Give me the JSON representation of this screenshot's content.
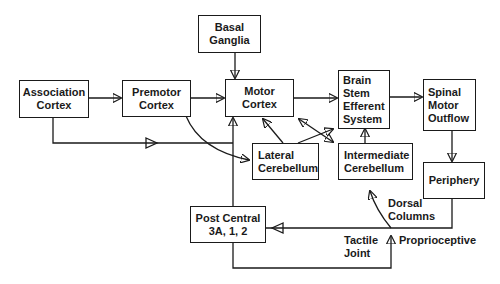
{
  "diagram": {
    "nodes": {
      "basal_ganglia": {
        "line1": "Basal",
        "line2": "Ganglia"
      },
      "association_cortex": {
        "line1": "Association",
        "line2": "Cortex"
      },
      "premotor_cortex": {
        "line1": "Premotor",
        "line2": "Cortex"
      },
      "motor_cortex": {
        "line1": "Motor",
        "line2": "Cortex"
      },
      "brain_stem": {
        "line1": "Brain",
        "line2": "Stem",
        "line3": "Efferent",
        "line4": "System"
      },
      "spinal_motor_outflow": {
        "line1": "Spinal",
        "line2": "Motor",
        "line3": "Outflow"
      },
      "lateral_cerebellum": {
        "line1": "Lateral",
        "line2": "Cerebellum"
      },
      "intermediate_cerebellum": {
        "line1": "Intermediate",
        "line2": "Cerebellum"
      },
      "periphery": {
        "line1": "Periphery"
      },
      "post_central": {
        "line1": "Post Central",
        "line2": "3A, 1, 2"
      }
    },
    "edge_labels": {
      "dorsal": "Dorsal",
      "columns": "Columns",
      "tactile": "Tactile",
      "joint": "Joint",
      "proprioceptive": "Proprioceptive"
    },
    "edges": [
      {
        "from": "Basal Ganglia",
        "to": "Motor Cortex"
      },
      {
        "from": "Association Cortex",
        "to": "Premotor Cortex"
      },
      {
        "from": "Premotor Cortex",
        "to": "Motor Cortex"
      },
      {
        "from": "Motor Cortex",
        "to": "Brain Stem Efferent System"
      },
      {
        "from": "Brain Stem Efferent System",
        "to": "Spinal Motor Outflow"
      },
      {
        "from": "Spinal Motor Outflow",
        "to": "Periphery"
      },
      {
        "from": "Association Cortex",
        "to": "Lateral Cerebellum"
      },
      {
        "from": "Premotor Cortex",
        "to": "Lateral Cerebellum"
      },
      {
        "from": "Lateral Cerebellum",
        "to": "Motor Cortex"
      },
      {
        "from": "Lateral Cerebellum",
        "to": "Brain Stem Efferent System"
      },
      {
        "from": "Motor Cortex",
        "to": "Intermediate Cerebellum",
        "bidirectional": true
      },
      {
        "from": "Intermediate Cerebellum",
        "to": "Brain Stem Efferent System"
      },
      {
        "from": "Periphery",
        "to": "Post Central 3A,1,2"
      },
      {
        "from": "Periphery",
        "to": "Intermediate Cerebellum",
        "label": "Dorsal Columns"
      },
      {
        "from": "Post Central 3A,1,2",
        "to": "Motor Cortex"
      },
      {
        "from": "Post Central 3A,1,2",
        "to": "Proprioceptive",
        "label": "Tactile Joint"
      }
    ]
  }
}
